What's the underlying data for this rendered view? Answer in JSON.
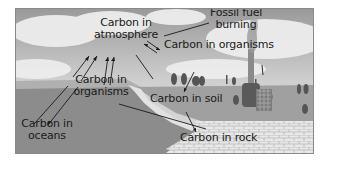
{
  "diagram": {
    "labels": {
      "atmosphere_line1": "Carbon in",
      "atmosphere_line2": "atmosphere",
      "fossil_line1": "Fossil fuel",
      "fossil_line2": "burning",
      "organisms_land": "Carbon in organisms",
      "soil": "Carbon in soil",
      "organisms_water_line1": "Carbon in",
      "organisms_water_line2": "organisms",
      "oceans_line1": "Carbon in",
      "oceans_line2": "oceans",
      "rock": "Carbon in rock"
    },
    "colors": {
      "sky": "#c9c9c9",
      "cloud": "#ececec",
      "ocean": "#8d8d8d",
      "land": "#a3a3a3",
      "rock": "#e6e6e6",
      "text": "#1a1a1a"
    }
  }
}
